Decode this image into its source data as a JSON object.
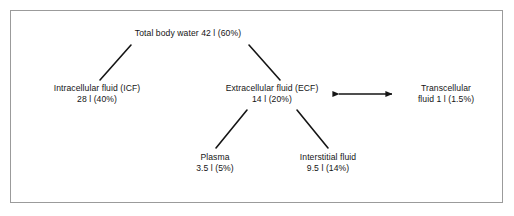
{
  "figure": {
    "frame_color": "#9b9b9b",
    "text_color": "#151515",
    "background_color": "#ffffff"
  },
  "nodes": {
    "total_body_water": {
      "name": "Total body water",
      "line1": "Total body water 42 l (60%)",
      "line2": "",
      "volume": "42 l",
      "percent": "60%"
    },
    "intracellular_fluid": {
      "name": "Intracellular fluid (ICF)",
      "line1": "Intracellular fluid (ICF)",
      "line2": "28 l (40%)",
      "volume": "28 l",
      "percent": "40%"
    },
    "extracellular_fluid": {
      "name": "Extracellular fluid (ECF)",
      "line1": "Extracellular fluid (ECF)",
      "line2": "14 l (20%)",
      "volume": "14 l",
      "percent": "20%"
    },
    "transcellular_fluid": {
      "name": "Transcellular fluid",
      "line1": "Transcellular",
      "line2": "fluid 1 l (1.5%)",
      "volume": "1 l",
      "percent": "1.5%"
    },
    "plasma": {
      "name": "Plasma",
      "line1": "Plasma",
      "line2": "3.5 l (5%)",
      "volume": "3.5 l",
      "percent": "5%"
    },
    "interstitial_fluid": {
      "name": "Interstitial fluid",
      "line1": "Interstitial fluid",
      "line2": "9.5 l (14%)",
      "volume": "9.5 l",
      "percent": "14%"
    }
  },
  "connectors": [
    {
      "id": "total-to-icf",
      "from": "total_body_water",
      "to": "intracellular_fluid",
      "style": "line"
    },
    {
      "id": "total-to-ecf",
      "from": "total_body_water",
      "to": "extracellular_fluid",
      "style": "line"
    },
    {
      "id": "ecf-to-plasma",
      "from": "extracellular_fluid",
      "to": "plasma",
      "style": "line"
    },
    {
      "id": "ecf-to-interstitial",
      "from": "extracellular_fluid",
      "to": "interstitial_fluid",
      "style": "line"
    },
    {
      "id": "ecf-to-transcellular",
      "from": "extracellular_fluid",
      "to": "transcellular_fluid",
      "style": "double-arrow"
    }
  ]
}
